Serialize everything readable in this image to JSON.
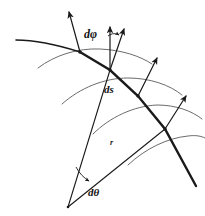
{
  "figure": {
    "background_color": "#ffffff",
    "stroke_color": "#1a1a1a",
    "arc_color": "#555555",
    "width": 205,
    "height": 216
  },
  "labels": {
    "dphi": "dφ",
    "ds": "ds",
    "r": "r",
    "dtheta": "dθ"
  },
  "nodes": [
    {
      "name": "node-1",
      "x": 80,
      "y": 52
    },
    {
      "name": "node-2",
      "x": 110,
      "y": 70
    },
    {
      "name": "node-3",
      "x": 138,
      "y": 96
    },
    {
      "name": "node-4",
      "x": 165,
      "y": 129
    },
    {
      "name": "apex",
      "x": 68,
      "y": 207
    }
  ],
  "arrows": [
    {
      "name": "normal-arrow-1",
      "x1": 80,
      "y1": 52,
      "x2": 69,
      "y2": 11
    },
    {
      "name": "normal-arrow-2",
      "x1": 110,
      "y1": 70,
      "x2": 110,
      "y2": 26
    },
    {
      "name": "normal-arrow-3",
      "x1": 110,
      "y1": 70,
      "x2": 124,
      "y2": 28
    },
    {
      "name": "normal-arrow-4",
      "x1": 138,
      "y1": 96,
      "x2": 157,
      "y2": 57
    },
    {
      "name": "normal-arrow-5",
      "x1": 165,
      "y1": 129,
      "x2": 186,
      "y2": 95
    }
  ],
  "radial_lines": [
    {
      "name": "radius-line-left",
      "x1": 110,
      "y1": 70,
      "x2": 68,
      "y2": 207
    },
    {
      "name": "radius-line-right",
      "x1": 165,
      "y1": 129,
      "x2": 68,
      "y2": 207
    }
  ],
  "main_curve": {
    "name": "thick-trajectory-curve",
    "description": "heavy curve descending left to right through all four nodes"
  },
  "arcs": [
    {
      "name": "wavefront-arc-1"
    },
    {
      "name": "wavefront-arc-2"
    },
    {
      "name": "wavefront-arc-3"
    },
    {
      "name": "wavefront-arc-4"
    }
  ],
  "angle_marks": [
    {
      "name": "dphi-angle-arc"
    },
    {
      "name": "dtheta-angle-arc"
    }
  ]
}
